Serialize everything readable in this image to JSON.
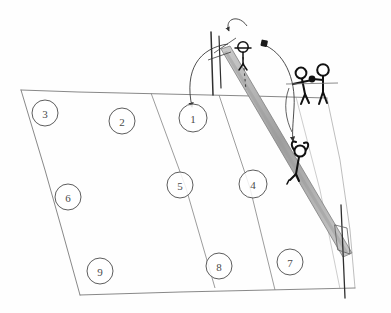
{
  "diagram": {
    "style": "hand-drawn pencil sketch",
    "background_color": "#fefefe",
    "line_color": "#6b6b6b",
    "ink_color": "#1a1a1a",
    "net_band_color": "#b8b8b8"
  },
  "court": {
    "name": "volleyball-court",
    "outline_color": "#7a7a7a",
    "zone_divider_count": 2,
    "zones": [
      {
        "id": "zone-3",
        "label": "3",
        "cx": 45,
        "cy": 113,
        "r": 13
      },
      {
        "id": "zone-2",
        "label": "2",
        "cx": 122,
        "cy": 121,
        "r": 13
      },
      {
        "id": "zone-1",
        "label": "1",
        "cx": 193,
        "cy": 118,
        "r": 14
      },
      {
        "id": "zone-6",
        "label": "6",
        "cx": 68,
        "cy": 197,
        "r": 13
      },
      {
        "id": "zone-5",
        "label": "5",
        "cx": 180,
        "cy": 185,
        "r": 13
      },
      {
        "id": "zone-4",
        "label": "4",
        "cx": 253,
        "cy": 184,
        "r": 14
      },
      {
        "id": "zone-9",
        "label": "9",
        "cx": 100,
        "cy": 271,
        "r": 13
      },
      {
        "id": "zone-8",
        "label": "8",
        "cx": 219,
        "cy": 266,
        "r": 13
      },
      {
        "id": "zone-7",
        "label": "7",
        "cx": 290,
        "cy": 262,
        "r": 13
      }
    ]
  },
  "net": {
    "name": "volleyball-net",
    "band_color": "#b9b9b9",
    "post_color": "#3a3a3a",
    "posts": [
      {
        "id": "net-post-near",
        "label": "near post"
      },
      {
        "id": "net-post-far",
        "label": "far post"
      }
    ]
  },
  "players": [
    {
      "id": "player-setter-at-net",
      "label": "setter at net",
      "x": 245,
      "y": 48
    },
    {
      "id": "player-hitter-arms-up",
      "label": "hitter arms raised",
      "x": 299,
      "y": 152
    },
    {
      "id": "player-passer-left",
      "label": "passer left",
      "x": 304,
      "y": 82
    },
    {
      "id": "player-passer-right",
      "label": "passer right",
      "x": 322,
      "y": 78
    }
  ],
  "ball": {
    "id": "ball",
    "label": "ball",
    "x": 264,
    "y": 43,
    "shape": "filled-square",
    "color": "#1a1a1a"
  },
  "trajectories": [
    {
      "id": "arc-serve-to-zone-1",
      "label": "arc into zone 1",
      "style": "solid",
      "has_arrowhead": true
    },
    {
      "id": "arc-toss-over-net",
      "label": "toss arc over net",
      "style": "solid",
      "has_arrowhead": true
    },
    {
      "id": "arc-set-to-hitter",
      "label": "set arc down to hitter",
      "style": "solid",
      "has_arrowhead": true
    },
    {
      "id": "dashed-drop-line",
      "label": "dashed drop line",
      "style": "dashed",
      "has_arrowhead": false
    }
  ]
}
